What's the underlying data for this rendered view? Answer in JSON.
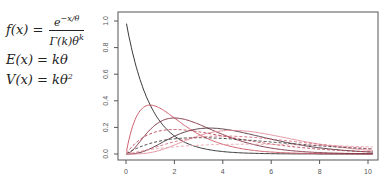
{
  "formulas": {
    "pdf_lhs": "f(x) =",
    "pdf_num": "e",
    "pdf_num_sup": "−x/θ",
    "pdf_den": "Γ(k)θ",
    "pdf_den_sup": "k",
    "mean": "E(x) = kθ",
    "variance_base": "V(x) = kθ",
    "variance_sup": "2"
  },
  "chart_data": {
    "type": "line",
    "title": "",
    "xlabel": "",
    "ylabel": "",
    "xlim": [
      0,
      10
    ],
    "ylim": [
      0,
      1.0
    ],
    "grid": false,
    "legend": false,
    "x_ticks": [
      "0",
      "2",
      "4",
      "6",
      "8",
      "10"
    ],
    "y_ticks": [
      "0.0",
      "0.2",
      "0.4",
      "0.6",
      "0.8",
      "1.0"
    ],
    "series": [
      {
        "name": "k=1, θ=1",
        "k": 1,
        "theta": 1,
        "color": "#222222",
        "dash": false,
        "peak": [
          0,
          1.0
        ]
      },
      {
        "name": "k=2, θ=1",
        "k": 2,
        "theta": 1,
        "color": "#c8505e",
        "dash": false,
        "peak": [
          1,
          0.37
        ]
      },
      {
        "name": "k=3, θ=1",
        "k": 3,
        "theta": 1,
        "color": "#7a2a3a",
        "dash": false,
        "peak": [
          2,
          0.27
        ]
      },
      {
        "name": "k=4, θ=1.15",
        "k": 4,
        "theta": 1.15,
        "color": "#4a2a36",
        "dash": false,
        "peak": [
          3.5,
          0.22
        ]
      },
      {
        "name": "k=5, θ=1.1",
        "k": 5,
        "theta": 1.1,
        "color": "#e08a9a",
        "dash": false,
        "peak": [
          4.4,
          0.19
        ]
      },
      {
        "name": "k=2, θ=2",
        "k": 2,
        "theta": 2,
        "color": "#b8404e",
        "dash": true,
        "peak": [
          2,
          0.18
        ]
      },
      {
        "name": "k=2, θ=3",
        "k": 2,
        "theta": 3,
        "color": "#333333",
        "dash": true,
        "peak": [
          3,
          0.12
        ]
      },
      {
        "name": "k=3, θ=2",
        "k": 3,
        "theta": 2,
        "color": "#d46a7a",
        "dash": true,
        "peak": [
          4,
          0.135
        ]
      },
      {
        "name": "k=2, θ=5",
        "k": 2,
        "theta": 5,
        "color": "#e8a0ac",
        "dash": true,
        "peak": [
          5,
          0.074
        ]
      }
    ]
  }
}
